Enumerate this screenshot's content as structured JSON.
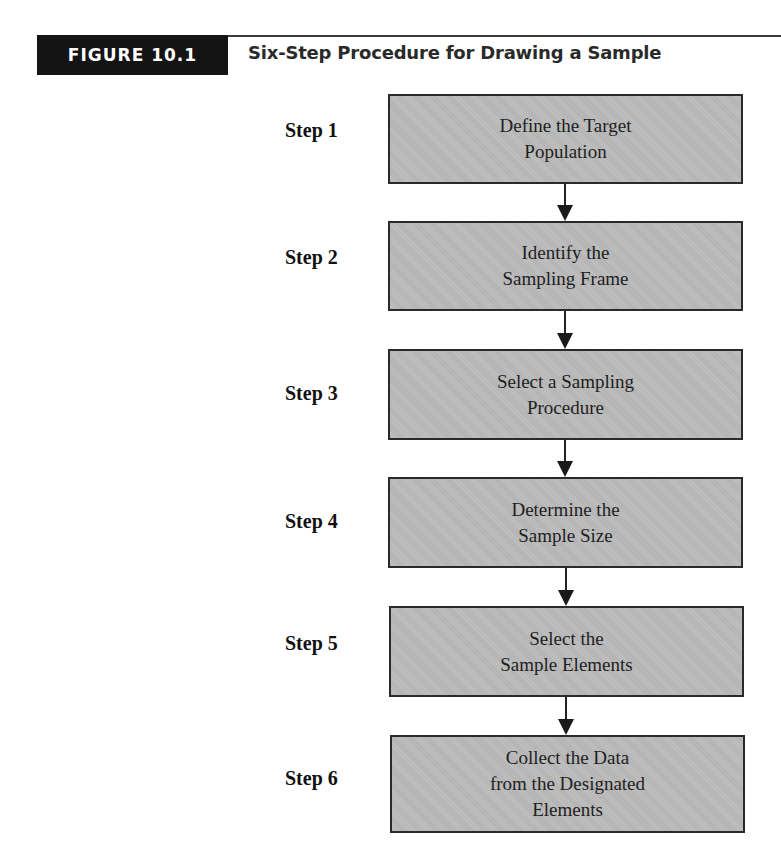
{
  "header": {
    "figure_label": "FIGURE 10.1",
    "title": "Six-Step Procedure for Drawing a Sample"
  },
  "diagram": {
    "type": "vertical-flowchart",
    "steps": [
      {
        "label": "Step 1",
        "text": "Define the Target\nPopulation"
      },
      {
        "label": "Step 2",
        "text": "Identify the\nSampling Frame"
      },
      {
        "label": "Step 3",
        "text": "Select a Sampling\nProcedure"
      },
      {
        "label": "Step 4",
        "text": "Determine the\nSample Size"
      },
      {
        "label": "Step 5",
        "text": "Select the\nSample Elements"
      },
      {
        "label": "Step 6",
        "text": "Collect the Data\nfrom the Designated\nElements"
      }
    ],
    "connections": [
      {
        "from": "Step 1",
        "to": "Step 2"
      },
      {
        "from": "Step 2",
        "to": "Step 3"
      },
      {
        "from": "Step 3",
        "to": "Step 4"
      },
      {
        "from": "Step 4",
        "to": "Step 5"
      },
      {
        "from": "Step 5",
        "to": "Step 6"
      }
    ],
    "colors": {
      "badge_bg": "#141414",
      "box_fill": "#b9b9b9",
      "box_border": "#2a2a2a",
      "arrow": "#1a1a1a"
    }
  }
}
